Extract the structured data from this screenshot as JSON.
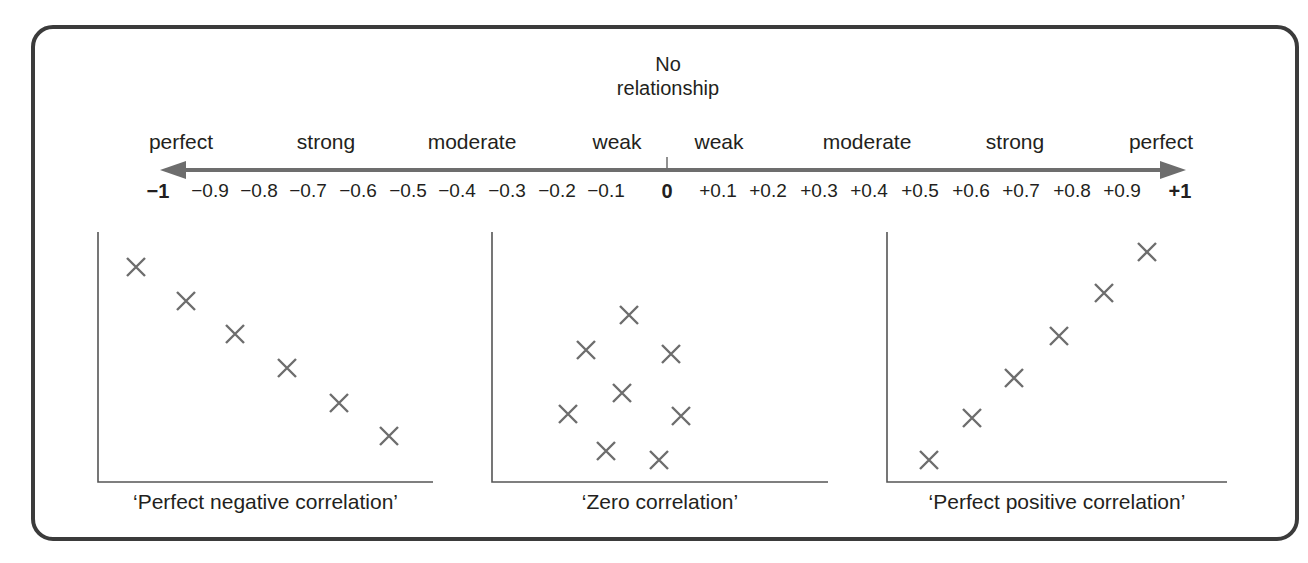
{
  "figure": {
    "center_label_line1": "No",
    "center_label_line2": "relationship",
    "strength_labels": [
      {
        "label": "perfect",
        "x": 181
      },
      {
        "label": "strong",
        "x": 326
      },
      {
        "label": "moderate",
        "x": 472
      },
      {
        "label": "weak",
        "x": 617
      },
      {
        "label": "weak",
        "x": 719
      },
      {
        "label": "moderate",
        "x": 867
      },
      {
        "label": "strong",
        "x": 1015
      },
      {
        "label": "perfect",
        "x": 1161
      }
    ],
    "scale_ticks": [
      {
        "label": "−1",
        "x": 158,
        "bold": true
      },
      {
        "label": "−0.9",
        "x": 210
      },
      {
        "label": "−0.8",
        "x": 259
      },
      {
        "label": "−0.7",
        "x": 308
      },
      {
        "label": "−0.6",
        "x": 358
      },
      {
        "label": "−0.5",
        "x": 408
      },
      {
        "label": "−0.4",
        "x": 457
      },
      {
        "label": "−0.3",
        "x": 507
      },
      {
        "label": "−0.2",
        "x": 557
      },
      {
        "label": "−0.1",
        "x": 606
      },
      {
        "label": "0",
        "x": 667,
        "bold": true
      },
      {
        "label": "+0.1",
        "x": 718
      },
      {
        "label": "+0.2",
        "x": 768
      },
      {
        "label": "+0.3",
        "x": 819
      },
      {
        "label": "+0.4",
        "x": 869
      },
      {
        "label": "+0.5",
        "x": 920
      },
      {
        "label": "+0.6",
        "x": 971
      },
      {
        "label": "+0.7",
        "x": 1021
      },
      {
        "label": "+0.8",
        "x": 1072
      },
      {
        "label": "+0.9",
        "x": 1122
      },
      {
        "label": "+1",
        "x": 1180,
        "bold": true
      }
    ],
    "colors": {
      "frame": "#3b3b3b",
      "arrow": "#6d6d6d",
      "marker": "#6d6d6d",
      "axis": "#555555",
      "text": "#231f20"
    }
  },
  "chart_data": [
    {
      "type": "scatter",
      "title": "'Perfect negative correlation'",
      "marker": "x",
      "points": [
        [
          1,
          6
        ],
        [
          2,
          5
        ],
        [
          3,
          4
        ],
        [
          4,
          3
        ],
        [
          5,
          2
        ],
        [
          6,
          1
        ]
      ],
      "pixel_points": [
        [
          136,
          267
        ],
        [
          186,
          301
        ],
        [
          235,
          334
        ],
        [
          287,
          368
        ],
        [
          339,
          403
        ],
        [
          389,
          436
        ]
      ],
      "axes": {
        "origin": [
          98,
          482
        ],
        "x_end": 433,
        "y_top": 232
      }
    },
    {
      "type": "scatter",
      "title": "'Zero correlation'",
      "marker": "x",
      "points": [
        [
          2.5,
          6
        ],
        [
          1.5,
          5
        ],
        [
          3.5,
          4.7
        ],
        [
          2.4,
          3.5
        ],
        [
          1,
          2.7
        ],
        [
          3.8,
          2.7
        ],
        [
          1.8,
          1.4
        ],
        [
          3.2,
          1.2
        ]
      ],
      "pixel_points": [
        [
          629,
          315
        ],
        [
          586,
          350
        ],
        [
          671,
          354
        ],
        [
          622,
          393
        ],
        [
          568,
          414
        ],
        [
          681,
          416
        ],
        [
          606,
          451
        ],
        [
          659,
          460
        ]
      ],
      "axes": {
        "origin": [
          492,
          482
        ],
        "x_end": 828,
        "y_top": 232
      }
    },
    {
      "type": "scatter",
      "title": "'Perfect positive correlation'",
      "marker": "x",
      "points": [
        [
          1,
          1
        ],
        [
          2,
          2
        ],
        [
          3,
          3
        ],
        [
          4,
          4
        ],
        [
          5,
          5
        ],
        [
          6,
          6
        ]
      ],
      "pixel_points": [
        [
          929,
          460
        ],
        [
          972,
          418
        ],
        [
          1014,
          378
        ],
        [
          1059,
          336
        ],
        [
          1104,
          293
        ],
        [
          1147,
          252
        ]
      ],
      "axes": {
        "origin": [
          887,
          482
        ],
        "x_end": 1227,
        "y_top": 232
      }
    }
  ],
  "scale": {
    "title": "Correlation coefficient scale",
    "min": -1,
    "max": 1,
    "step": 0.1,
    "center_annotation": "No relationship"
  }
}
